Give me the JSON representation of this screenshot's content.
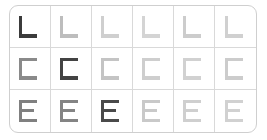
{
  "card": {
    "background_color": "#ffffff",
    "border_color": "#cfcfcf",
    "gridline_color": "#d9d9d9",
    "corner_radius_px": 9,
    "rows": 3,
    "columns": 6
  },
  "legend": {
    "emphasis_note": "one cell per row is rendered at full contrast"
  },
  "chart_data": {
    "type": "heatmap",
    "title": "",
    "xlabel": "",
    "ylabel": "",
    "grid": true,
    "legend_position": "none",
    "columns": [
      1,
      2,
      3,
      4,
      5,
      6
    ],
    "row_labels": [
      "L",
      "C",
      "E"
    ],
    "series": [
      {
        "name": "L",
        "glyph": "L",
        "emphasis_column": 1,
        "values": [
          88,
          22,
          16,
          14,
          17,
          15
        ],
        "colors": [
          "#3b3b3b",
          "#bdbdbd",
          "#cfcfcf",
          "#d4d4d4",
          "#cccccc",
          "#d0d0d0"
        ]
      },
      {
        "name": "C",
        "glyph": "C",
        "emphasis_column": 2,
        "values": [
          58,
          84,
          20,
          16,
          15,
          17
        ],
        "colors": [
          "#8a8a8a",
          "#434343",
          "#c4c4c4",
          "#cecece",
          "#d1d1d1",
          "#cccccc"
        ]
      },
      {
        "name": "E",
        "glyph": "E",
        "emphasis_column": 3,
        "values": [
          62,
          60,
          82,
          18,
          16,
          15
        ],
        "colors": [
          "#808080",
          "#848484",
          "#4a4a4a",
          "#c9c9c9",
          "#cfcfcf",
          "#d1d1d1"
        ]
      }
    ]
  }
}
